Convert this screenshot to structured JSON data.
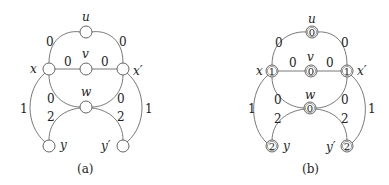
{
  "panels": [
    {
      "caption": "(a)",
      "nodes": {
        "u": {
          "name": "u",
          "value": ""
        },
        "v": {
          "name": "v",
          "value": ""
        },
        "w": {
          "name": "w",
          "value": ""
        },
        "x": {
          "name": "x",
          "value": ""
        },
        "xp": {
          "name": "x′",
          "value": ""
        },
        "y": {
          "name": "y",
          "value": ""
        },
        "yp": {
          "name": "y′",
          "value": ""
        }
      },
      "edges": {
        "x_u": "0",
        "u_xp": "0",
        "x_v": "0",
        "v_xp": "0",
        "x_w": "0",
        "xp_w": "0",
        "w_y": "2",
        "w_yp": "2",
        "x_y": "1",
        "xp_yp": "1"
      }
    },
    {
      "caption": "(b)",
      "nodes": {
        "u": {
          "name": "u",
          "value": "0"
        },
        "v": {
          "name": "v",
          "value": "0"
        },
        "w": {
          "name": "w",
          "value": "0"
        },
        "x": {
          "name": "x",
          "value": "1"
        },
        "xp": {
          "name": "x′",
          "value": "1"
        },
        "y": {
          "name": "y",
          "value": "2"
        },
        "yp": {
          "name": "y′",
          "value": "2"
        }
      },
      "edges": {
        "x_u": "0",
        "u_xp": "0",
        "x_v": "0",
        "v_xp": "0",
        "x_w": "0",
        "xp_w": "0",
        "w_y": "2",
        "w_yp": "2",
        "x_y": "1",
        "xp_yp": "1"
      }
    }
  ]
}
